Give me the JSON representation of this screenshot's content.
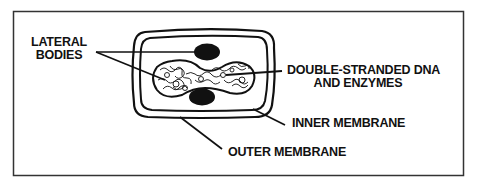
{
  "diagram": {
    "labels": {
      "lateral_bodies_line1": "LATERAL",
      "lateral_bodies_line2": "BODIES",
      "dna_line1": "DOUBLE-STRANDED DNA",
      "dna_line2": "AND ENZYMES",
      "inner_membrane": "INNER MEMBRANE",
      "outer_membrane": "OUTER MEMBRANE"
    },
    "colors": {
      "ink": "#111111",
      "background": "#ffffff",
      "frame": "#333333"
    }
  }
}
